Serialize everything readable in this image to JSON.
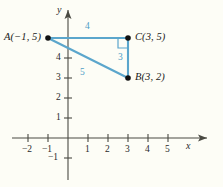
{
  "figure": {
    "background_color": "#fdfdf6",
    "axis_color": "#4a4a42",
    "line_color": "#4e9ec6",
    "point_color": "#111111",
    "text_color": "#1a1a1a",
    "axes": {
      "x_name": "x",
      "y_name": "y",
      "origin_px": {
        "x": 68,
        "y": 138
      },
      "unit_px": 20,
      "x_ticks": [
        {
          "value": -2,
          "label": "−2"
        },
        {
          "value": -1,
          "label": "−1"
        },
        {
          "value": 1,
          "label": "1"
        },
        {
          "value": 2,
          "label": "2"
        },
        {
          "value": 3,
          "label": "3"
        },
        {
          "value": 4,
          "label": "4"
        },
        {
          "value": 5,
          "label": "5"
        }
      ],
      "y_ticks": [
        {
          "value": -1,
          "label": "−1"
        },
        {
          "value": 1,
          "label": "1"
        },
        {
          "value": 2,
          "label": "2"
        },
        {
          "value": 3,
          "label": "3"
        },
        {
          "value": 4,
          "label": "4"
        },
        {
          "value": 5,
          "label": ""
        }
      ]
    },
    "points": [
      {
        "id": "A",
        "label": "A(−1, 5)",
        "x": -1,
        "y": 5,
        "label_side": "left"
      },
      {
        "id": "C",
        "label": "C(3, 5)",
        "x": 3,
        "y": 5,
        "label_side": "right"
      },
      {
        "id": "B",
        "label": "B(3, 2)",
        "x": 3,
        "y": 2,
        "label_side": "right"
      }
    ],
    "segments": [
      {
        "id": "AC",
        "from": "A",
        "to": "C",
        "length_label": "4"
      },
      {
        "id": "CB",
        "from": "C",
        "to": "B",
        "length_label": "3"
      },
      {
        "id": "AB",
        "from": "A",
        "to": "B",
        "length_label": "5"
      }
    ],
    "right_angle_at": "C"
  }
}
